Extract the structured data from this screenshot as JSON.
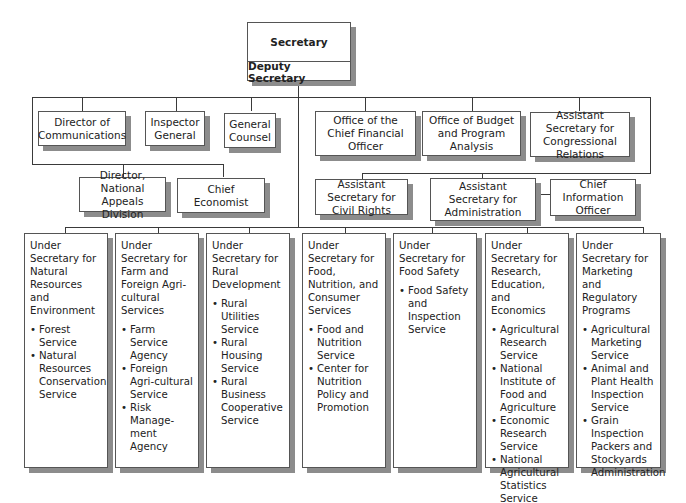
{
  "chart": {
    "top": {
      "secretary": "Secretary",
      "deputy": "Deputy Secretary"
    },
    "staff_left_row1": [
      {
        "label": "Director of Communications"
      },
      {
        "label": "Inspector General"
      },
      {
        "label": "General Counsel"
      }
    ],
    "staff_left_row2": [
      {
        "label": "Director, National Appeals Division"
      },
      {
        "label": "Chief Economist"
      }
    ],
    "staff_right_row1": [
      {
        "label": "Office of the Chief Financial Officer"
      },
      {
        "label": "Office of Budget and Program Analysis"
      },
      {
        "label": "Assistant Secretary for Congressional Relations"
      }
    ],
    "staff_right_row2": [
      {
        "label": "Assistant Secretary for Civil Rights"
      },
      {
        "label": "Assistant Secretary for Administration"
      },
      {
        "label": "Chief Information Officer"
      }
    ],
    "under_secretaries": [
      {
        "title": "Under Secretary for Natural Resources and Environment",
        "items": [
          "Forest Service",
          "Natural Resources Conservation Service"
        ]
      },
      {
        "title": "Under Secretary for Farm and Foreign Agri-cultural Services",
        "items": [
          "Farm Service Agency",
          "Foreign Agri-cultural Service",
          "Risk Manage-ment Agency"
        ]
      },
      {
        "title": "Under Secretary for Rural Development",
        "items": [
          "Rural Utilities Service",
          "Rural Housing Service",
          "Rural Business Cooperative Service"
        ]
      },
      {
        "title": "Under Secretary for Food, Nutrition, and Consumer Services",
        "items": [
          "Food and Nutrition Service",
          "Center for Nutrition Policy and Promotion"
        ]
      },
      {
        "title": "Under Secretary for Food Safety",
        "items": [
          "Food Safety and Inspection Service"
        ]
      },
      {
        "title": "Under Secretary for Research, Education, and Economics",
        "items": [
          "Agricultural Research Service",
          "National Institute of Food and Agriculture",
          "Economic Research Service",
          "National Agricultural Statistics Service"
        ]
      },
      {
        "title": "Under Secretary for Marketing and Regulatory Programs",
        "items": [
          "Agricultural Marketing Service",
          "Animal and Plant Health Inspection Service",
          "Grain Inspection Packers and Stockyards Administration"
        ]
      }
    ]
  },
  "colors": {
    "line": "#3a3a3a",
    "border": "#555555",
    "shadow": "#8c8c8c",
    "background": "#ffffff"
  }
}
